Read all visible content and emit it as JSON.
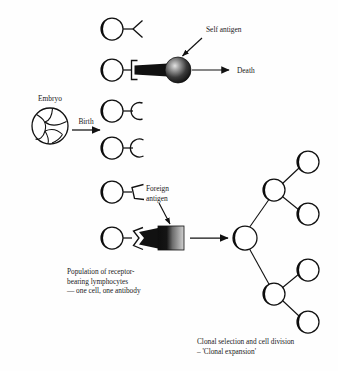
{
  "figure": {
    "background_color": "#fefefe",
    "ink_color": "#111111",
    "width": 338,
    "height": 371
  },
  "labels": {
    "embryo": "Embryo",
    "birth": "Birth",
    "self_antigen": "Self antigen",
    "death": "Death",
    "foreign_antigen_line1": "Foreign",
    "foreign_antigen_line2": "antigen",
    "population_line1": "Population of receptor-",
    "population_line2": "bearing lymphocytes",
    "population_line3": "— one cell, one antibody",
    "clonal_line1": "Clonal selection and cell division",
    "clonal_line2": "– 'Clonal expansion'"
  },
  "elements": {
    "embryo": {
      "name": "embryo-cluster",
      "cx": 50,
      "cy": 126,
      "r": 18,
      "description": "circle subdivided into irregular cell compartments"
    },
    "birth_arrow": {
      "name": "birth-arrow",
      "x1": 72,
      "y1": 130,
      "x2": 100,
      "y2": 130
    },
    "death_arrow": {
      "name": "death-arrow",
      "x1": 190,
      "y1": 70,
      "x2": 228,
      "y2": 70
    },
    "activation_arrow": {
      "name": "activation-arrow",
      "x1": 185,
      "y1": 238,
      "x2": 225,
      "y2": 238
    },
    "self_antigen_pointer": {
      "name": "self-antigen-pointer-arrow",
      "x1": 202,
      "y1": 38,
      "x2": 180,
      "y2": 58
    },
    "foreign_antigen_pointer": {
      "name": "foreign-antigen-pointer-arrow",
      "x1": 160,
      "y1": 205,
      "x2": 170,
      "y2": 228
    },
    "self_antigen_sphere": {
      "name": "self-antigen-sphere",
      "cx": 178,
      "cy": 70,
      "r": 13,
      "fill_dark": "#1a1a1a",
      "fill_highlight": "#d8d8d8"
    },
    "foreign_antigen_block": {
      "name": "foreign-antigen-block",
      "x": 158,
      "y": 226,
      "width": 26,
      "height": 24,
      "fill_dark": "#121212",
      "fill_light": "#c9c9c9"
    }
  },
  "lymphocytes": [
    {
      "id": "cell-1",
      "cx": 112,
      "cy": 29,
      "r": 11,
      "receptor": "y-shape",
      "bound": false,
      "row": 1
    },
    {
      "id": "cell-2",
      "cx": 112,
      "cy": 70,
      "r": 11,
      "receptor": "bracket-shape",
      "bound": true,
      "row": 2,
      "binds": "self-antigen"
    },
    {
      "id": "cell-3",
      "cx": 112,
      "cy": 111,
      "r": 11,
      "receptor": "c-shape",
      "bound": false,
      "row": 3
    },
    {
      "id": "cell-4",
      "cx": 112,
      "cy": 148,
      "r": 11,
      "receptor": "c-shape",
      "bound": false,
      "row": 4
    },
    {
      "id": "cell-5",
      "cx": 112,
      "cy": 192,
      "r": 11,
      "receptor": "pentagon-shape",
      "bound": false,
      "row": 5
    },
    {
      "id": "cell-6",
      "cx": 112,
      "cy": 238,
      "r": 11,
      "receptor": "notch-shape",
      "bound": true,
      "row": 6,
      "binds": "foreign-antigen"
    }
  ],
  "clonal_tree": {
    "root": {
      "id": "clone-root",
      "cx": 245,
      "cy": 238,
      "r": 12
    },
    "level1": [
      {
        "id": "clone-l1-top",
        "cx": 274,
        "cy": 190,
        "r": 11
      },
      {
        "id": "clone-l1-bottom",
        "cx": 274,
        "cy": 294,
        "r": 11
      }
    ],
    "level2": [
      {
        "id": "clone-l2-a",
        "cx": 308,
        "cy": 162,
        "r": 11
      },
      {
        "id": "clone-l2-b",
        "cx": 308,
        "cy": 214,
        "r": 11
      },
      {
        "id": "clone-l2-c",
        "cx": 308,
        "cy": 270,
        "r": 11
      },
      {
        "id": "clone-l2-d",
        "cx": 308,
        "cy": 322,
        "r": 11
      }
    ],
    "total_cells": 7
  },
  "text_positions": {
    "embryo": {
      "x": 50,
      "y": 101,
      "anchor": "middle"
    },
    "birth": {
      "x": 86,
      "y": 124,
      "anchor": "middle"
    },
    "self_antigen": {
      "x": 206,
      "y": 32,
      "anchor": "start"
    },
    "death": {
      "x": 236,
      "y": 73,
      "anchor": "start"
    },
    "foreign_1": {
      "x": 146,
      "y": 191,
      "anchor": "start"
    },
    "foreign_2": {
      "x": 146,
      "y": 200,
      "anchor": "start"
    },
    "population_1": {
      "x": 67,
      "y": 274,
      "anchor": "start"
    },
    "population_2": {
      "x": 67,
      "y": 283,
      "anchor": "start"
    },
    "population_3": {
      "x": 67,
      "y": 292,
      "anchor": "start"
    },
    "clonal_1": {
      "x": 197,
      "y": 344,
      "anchor": "start"
    },
    "clonal_2": {
      "x": 197,
      "y": 353,
      "anchor": "start"
    }
  }
}
